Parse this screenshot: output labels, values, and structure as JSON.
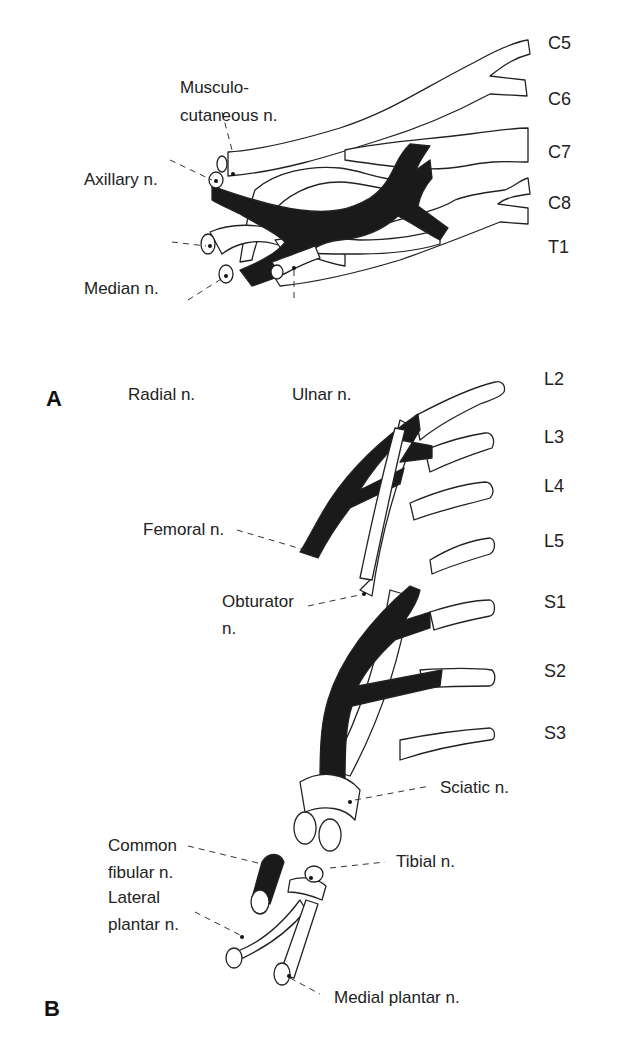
{
  "figure": {
    "panels": [
      {
        "id": "A",
        "letter": "A",
        "title": "Brachial plexus",
        "roots": [
          "C5",
          "C6",
          "C7",
          "C8",
          "T1"
        ],
        "nerves": {
          "musculocutaneous_line1": "Musculo-",
          "musculocutaneous_line2": "cutaneous n.",
          "axillary": "Axillary n.",
          "median": "Median n.",
          "radial": "Radial n.",
          "ulnar": "Ulnar n."
        }
      },
      {
        "id": "B",
        "letter": "B",
        "title": "Lumbosacral plexus",
        "roots": [
          "L2",
          "L3",
          "L4",
          "L5",
          "S1",
          "S2",
          "S3"
        ],
        "nerves": {
          "femoral": "Femoral n.",
          "obturator_line1": "Obturator",
          "obturator_line2": "n.",
          "sciatic": "Sciatic n.",
          "common_fibular_line1": "Common",
          "common_fibular_line2": "fibular n.",
          "tibial": "Tibial n.",
          "lateral_plantar_line1": "Lateral",
          "lateral_plantar_line2": "plantar n.",
          "medial_plantar": "Medial plantar n."
        }
      }
    ],
    "colors": {
      "posterior_division": "#1a1a1a",
      "anterior_division": "#ffffff",
      "outline": "#222222"
    }
  }
}
